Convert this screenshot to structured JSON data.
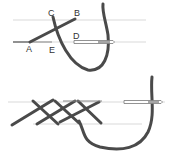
{
  "diagram": {
    "title": "",
    "colors": {
      "thread": "#4a4a4a",
      "guideline": "#c8c8c8",
      "needle": "#777777",
      "label": "#333333"
    },
    "top_panel": {
      "labels": {
        "A": "A",
        "B": "B",
        "C": "C",
        "D": "D",
        "E": "E"
      }
    },
    "bottom_panel": {
      "labels": {}
    }
  }
}
